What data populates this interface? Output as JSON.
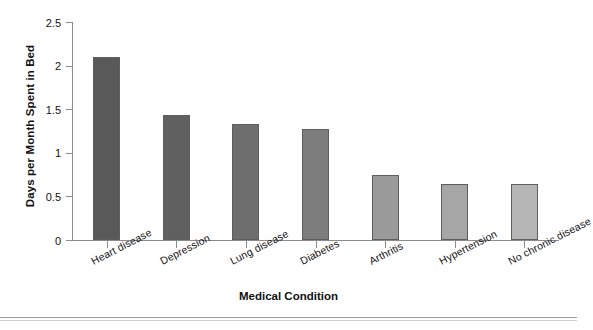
{
  "chart_data": {
    "type": "bar",
    "title": "",
    "xlabel": "Medical Condition",
    "ylabel": "Days per Month Spent in Bed",
    "categories": [
      "Heart disease",
      "Depression",
      "Lung disease",
      "Diabetes",
      "Arthritis",
      "Hypertension",
      "No chronic disease"
    ],
    "values": [
      2.1,
      1.43,
      1.33,
      1.27,
      0.74,
      0.64,
      0.64
    ],
    "ylim": [
      0,
      2.5
    ],
    "yticks": [
      "0",
      "0.5",
      "1",
      "1.5",
      "2",
      "2.5"
    ],
    "ytick_values": [
      0,
      0.5,
      1,
      1.5,
      2,
      2.5
    ],
    "grid": false,
    "legend": "none",
    "bar_colors": [
      "#595959",
      "#606060",
      "#6e6e6e",
      "#7d7d7d",
      "#9a9a9a",
      "#a6a6a6",
      "#b5b5b5"
    ],
    "bar_edge_color": "#5e5e5e",
    "axis_color": "#8c8c8c"
  }
}
